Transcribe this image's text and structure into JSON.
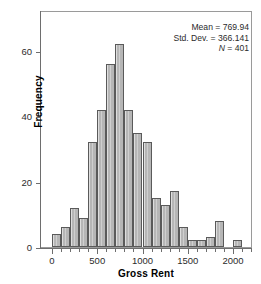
{
  "figure": {
    "top_sliver_text": "",
    "background": "#ffffff",
    "bar_fill": "#b6b6b6",
    "bar_stroke": "#5a5a5a",
    "axis_color": "#6e6e6e"
  },
  "stats": {
    "mean_label": "Mean = 769.94",
    "stddev_label": "Std. Dev. = 366.141",
    "n_label_italic": "N",
    "n_label_rest": " = 401",
    "mean": 769.94,
    "std_dev": 366.141,
    "n": 401
  },
  "axes": {
    "xlabel": "Gross Rent",
    "ylabel": "Frequency",
    "xticks": [
      0,
      500,
      1000,
      1500,
      2000
    ],
    "yticks": [
      0,
      20,
      40,
      60
    ],
    "xlim": [
      -50,
      2300
    ],
    "ylim": [
      0,
      72
    ]
  },
  "chart_data": {
    "type": "bar",
    "title": "",
    "xlabel": "Gross Rent",
    "ylabel": "Frequency",
    "xlim": [
      -50,
      2300
    ],
    "ylim": [
      0,
      72
    ],
    "xticks": [
      0,
      500,
      1000,
      1500,
      2000
    ],
    "yticks": [
      0,
      20,
      40,
      60
    ],
    "grid": false,
    "legend": "none",
    "bin_width": 100,
    "bin_starts": [
      0,
      100,
      200,
      300,
      400,
      500,
      600,
      700,
      800,
      900,
      1000,
      1100,
      1200,
      1300,
      1400,
      1500,
      1600,
      1700,
      1800,
      1900,
      2000
    ],
    "categories": [
      "0-100",
      "100-200",
      "200-300",
      "300-400",
      "400-500",
      "500-600",
      "600-700",
      "700-800",
      "800-900",
      "900-1000",
      "1000-1100",
      "1100-1200",
      "1200-1300",
      "1300-1400",
      "1400-1500",
      "1500-1600",
      "1600-1700",
      "1700-1800",
      "1800-1900",
      "1900-2000",
      "2000-2100"
    ],
    "values": [
      4,
      6,
      12,
      9,
      32,
      42,
      56,
      62,
      42,
      35,
      32,
      15,
      13,
      17,
      6,
      2,
      2,
      3,
      8,
      0,
      2
    ],
    "annotations": [
      "Mean = 769.94",
      "Std. Dev. = 366.141",
      "N = 401"
    ]
  }
}
